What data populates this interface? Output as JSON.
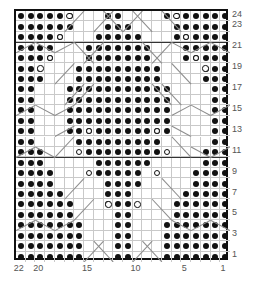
{
  "chart": {
    "kind": "knitting-stitch-chart",
    "title": "",
    "columns": 22,
    "rows": 24,
    "column_numbering_direction": "right-to-left",
    "row_numbering_direction": "bottom-to-top",
    "colors": {
      "grid_line": "#c9c9c9",
      "frame": "#111111",
      "symbol_fill": "#111111",
      "background": "#ffffff",
      "label": "#555555",
      "repeat_rule": "#333333"
    },
    "row_labels": [
      {
        "row": 24,
        "label": "24"
      },
      {
        "row": 23,
        "label": "23"
      },
      {
        "row": 21,
        "label": "21"
      },
      {
        "row": 19,
        "label": "19"
      },
      {
        "row": 17,
        "label": "17"
      },
      {
        "row": 15,
        "label": "15"
      },
      {
        "row": 13,
        "label": "13"
      },
      {
        "row": 11,
        "label": "11"
      },
      {
        "row": 9,
        "label": "9"
      },
      {
        "row": 7,
        "label": "7"
      },
      {
        "row": 5,
        "label": "5"
      },
      {
        "row": 3,
        "label": "3"
      },
      {
        "row": 1,
        "label": "1"
      }
    ],
    "column_labels": [
      {
        "col": 22,
        "label": "22"
      },
      {
        "col": 20,
        "label": "20"
      },
      {
        "col": 15,
        "label": "15"
      },
      {
        "col": 10,
        "label": "10"
      },
      {
        "col": 5,
        "label": "5"
      },
      {
        "col": 1,
        "label": "1"
      }
    ],
    "repeat_rules_after_rows": [
      21,
      10
    ],
    "symbols": {
      "dot": "purl-stitch",
      "ring": "yarn-over"
    },
    "dots": {
      "24": [
        1,
        2,
        3,
        4,
        5,
        6,
        7,
        12,
        13,
        17,
        18,
        19,
        20,
        21,
        22
      ],
      "23": [
        1,
        2,
        3,
        4,
        5,
        6,
        11,
        12,
        13,
        17,
        18,
        19,
        20,
        21,
        22
      ],
      "22": [
        1,
        2,
        3,
        4,
        5,
        6,
        10,
        11,
        12,
        13,
        14,
        18,
        19,
        20,
        21,
        22
      ],
      "21": [
        1,
        2,
        3,
        4,
        5,
        9,
        10,
        11,
        12,
        13,
        14,
        15,
        19,
        20,
        21,
        22
      ],
      "20": [
        1,
        2,
        3,
        4,
        5,
        9,
        10,
        11,
        12,
        13,
        14,
        15,
        19,
        20,
        21,
        22
      ],
      "19": [
        1,
        2,
        3,
        8,
        9,
        10,
        11,
        12,
        13,
        14,
        15,
        16,
        20,
        21,
        22
      ],
      "18": [
        1,
        2,
        3,
        8,
        9,
        10,
        11,
        12,
        13,
        14,
        15,
        16,
        20,
        21,
        22
      ],
      "17": [
        1,
        2,
        7,
        8,
        9,
        10,
        11,
        12,
        13,
        14,
        15,
        16,
        17,
        21,
        22
      ],
      "16": [
        1,
        2,
        7,
        8,
        9,
        10,
        11,
        12,
        13,
        14,
        15,
        16,
        17,
        21,
        22
      ],
      "15": [
        1,
        2,
        7,
        8,
        9,
        10,
        11,
        12,
        13,
        14,
        15,
        16,
        17,
        21,
        22
      ],
      "14": [
        1,
        2,
        7,
        8,
        9,
        10,
        11,
        12,
        13,
        14,
        15,
        16,
        17,
        21,
        22
      ],
      "13": [
        1,
        2,
        7,
        8,
        9,
        10,
        11,
        12,
        13,
        14,
        15,
        16,
        17,
        21,
        22
      ],
      "12": [
        1,
        2,
        8,
        9,
        10,
        11,
        12,
        13,
        14,
        15,
        16,
        21,
        22
      ],
      "11": [
        1,
        2,
        3,
        8,
        9,
        10,
        11,
        12,
        13,
        14,
        15,
        20,
        21,
        22
      ],
      "10": [
        1,
        2,
        3,
        9,
        10,
        11,
        12,
        13,
        14,
        20,
        21,
        22
      ],
      "9": [
        1,
        2,
        3,
        4,
        10,
        11,
        12,
        13,
        14,
        19,
        20,
        21,
        22
      ],
      "8": [
        1,
        2,
        3,
        4,
        10,
        11,
        12,
        13,
        19,
        20,
        21,
        22
      ],
      "7": [
        1,
        2,
        3,
        4,
        5,
        11,
        12,
        13,
        18,
        19,
        20,
        21,
        22
      ],
      "6": [
        1,
        2,
        3,
        4,
        5,
        6,
        11,
        12,
        13,
        17,
        18,
        19,
        20,
        21,
        22
      ],
      "5": [
        1,
        2,
        3,
        4,
        5,
        6,
        11,
        12,
        17,
        18,
        19,
        20,
        21,
        22
      ],
      "4": [
        1,
        2,
        3,
        4,
        5,
        6,
        7,
        11,
        12,
        16,
        17,
        18,
        19,
        20,
        21,
        22
      ],
      "3": [
        1,
        2,
        3,
        4,
        5,
        6,
        7,
        11,
        12,
        16,
        17,
        18,
        19,
        20,
        21,
        22
      ],
      "2": [
        1,
        2,
        3,
        4,
        5,
        6,
        7,
        11,
        12,
        16,
        17,
        18,
        19,
        20,
        21,
        22
      ],
      "1": [
        1,
        2,
        3,
        4,
        5,
        6,
        7,
        11,
        12,
        16,
        17,
        18,
        19,
        20,
        21,
        22
      ]
    },
    "rings": {
      "24": [
        17,
        6
      ],
      "22": [
        18,
        5
      ],
      "20": [
        19,
        4
      ],
      "19": [
        20,
        3
      ],
      "13": [
        15,
        8
      ],
      "11": [
        16,
        7
      ],
      "9": [
        15,
        8
      ],
      "6": [
        13,
        10
      ]
    },
    "lines": [
      {
        "x1": 0.0,
        "y1": 4.0,
        "x2": 2.0,
        "y2": 3.0
      },
      {
        "x1": 2.0,
        "y1": 3.0,
        "x2": 4.0,
        "y2": 4.0
      },
      {
        "x1": 4.0,
        "y1": 4.0,
        "x2": 6.0,
        "y2": 3.0
      },
      {
        "x1": 5.0,
        "y1": 2.0,
        "x2": 7.0,
        "y2": 0.0
      },
      {
        "x1": 9.0,
        "y1": 0.0,
        "x2": 11.0,
        "y2": 2.0
      },
      {
        "x1": 11.0,
        "y1": 2.0,
        "x2": 13.0,
        "y2": 0.0
      },
      {
        "x1": 15.0,
        "y1": 0.0,
        "x2": 17.0,
        "y2": 2.0
      },
      {
        "x1": 16.0,
        "y1": 3.0,
        "x2": 18.0,
        "y2": 4.0
      },
      {
        "x1": 18.0,
        "y1": 4.0,
        "x2": 20.0,
        "y2": 3.0
      },
      {
        "x1": 20.0,
        "y1": 3.0,
        "x2": 22.0,
        "y2": 4.0
      },
      {
        "x1": 6.0,
        "y1": 3.0,
        "x2": 8.0,
        "y2": 5.0
      },
      {
        "x1": 14.0,
        "y1": 5.0,
        "x2": 16.0,
        "y2": 3.0
      },
      {
        "x1": 0.0,
        "y1": 10.0,
        "x2": 2.0,
        "y2": 9.0
      },
      {
        "x1": 2.0,
        "y1": 9.0,
        "x2": 4.0,
        "y2": 10.0
      },
      {
        "x1": 4.0,
        "y1": 10.0,
        "x2": 6.0,
        "y2": 9.0
      },
      {
        "x1": 18.0,
        "y1": 9.0,
        "x2": 20.0,
        "y2": 10.0
      },
      {
        "x1": 20.0,
        "y1": 10.0,
        "x2": 22.0,
        "y2": 9.0
      },
      {
        "x1": 16.0,
        "y1": 10.0,
        "x2": 18.0,
        "y2": 9.0
      },
      {
        "x1": 6.0,
        "y1": 9.0,
        "x2": 8.0,
        "y2": 7.0
      },
      {
        "x1": 14.0,
        "y1": 7.0,
        "x2": 16.0,
        "y2": 9.0
      },
      {
        "x1": 0.0,
        "y1": 14.0,
        "x2": 2.0,
        "y2": 13.0
      },
      {
        "x1": 2.0,
        "y1": 13.0,
        "x2": 4.0,
        "y2": 14.0
      },
      {
        "x1": 18.0,
        "y1": 13.0,
        "x2": 20.0,
        "y2": 14.0
      },
      {
        "x1": 20.0,
        "y1": 14.0,
        "x2": 22.0,
        "y2": 13.0
      },
      {
        "x1": 4.0,
        "y1": 14.0,
        "x2": 6.0,
        "y2": 12.0
      },
      {
        "x1": 16.0,
        "y1": 12.0,
        "x2": 18.0,
        "y2": 14.0
      },
      {
        "x1": 0.0,
        "y1": 21.0,
        "x2": 2.0,
        "y2": 20.0
      },
      {
        "x1": 2.0,
        "y1": 20.0,
        "x2": 4.0,
        "y2": 21.0
      },
      {
        "x1": 4.0,
        "y1": 21.0,
        "x2": 6.0,
        "y2": 20.0
      },
      {
        "x1": 16.0,
        "y1": 20.0,
        "x2": 18.0,
        "y2": 21.0
      },
      {
        "x1": 18.0,
        "y1": 21.0,
        "x2": 20.0,
        "y2": 20.0
      },
      {
        "x1": 20.0,
        "y1": 20.0,
        "x2": 22.0,
        "y2": 21.0
      },
      {
        "x1": 7.0,
        "y1": 24.0,
        "x2": 9.0,
        "y2": 22.0
      },
      {
        "x1": 13.0,
        "y1": 22.0,
        "x2": 15.0,
        "y2": 24.0
      },
      {
        "x1": 6.0,
        "y1": 20.0,
        "x2": 8.0,
        "y2": 18.0
      },
      {
        "x1": 14.0,
        "y1": 18.0,
        "x2": 16.0,
        "y2": 20.0
      },
      {
        "x1": 5.0,
        "y1": 18.0,
        "x2": 7.0,
        "y2": 16.0
      },
      {
        "x1": 15.0,
        "y1": 16.0,
        "x2": 17.0,
        "y2": 18.0
      },
      {
        "x1": 4.0,
        "y1": 12.0,
        "x2": 6.0,
        "y2": 11.0
      },
      {
        "x1": 16.0,
        "y1": 11.0,
        "x2": 18.0,
        "y2": 12.0
      },
      {
        "x1": 5.0,
        "y1": 9.0,
        "x2": 7.0,
        "y2": 7.0
      },
      {
        "x1": 15.0,
        "y1": 7.0,
        "x2": 17.0,
        "y2": 9.0
      },
      {
        "x1": 4.0,
        "y1": 7.0,
        "x2": 6.0,
        "y2": 5.0
      },
      {
        "x1": 16.0,
        "y1": 5.0,
        "x2": 18.0,
        "y2": 7.0
      },
      {
        "x1": 7.0,
        "y1": 5.0,
        "x2": 9.0,
        "y2": 3.0
      },
      {
        "x1": 13.0,
        "y1": 3.0,
        "x2": 15.0,
        "y2": 5.0
      },
      {
        "x1": 8.0,
        "y1": 22.0,
        "x2": 10.0,
        "y2": 24.0
      },
      {
        "x1": 12.0,
        "y1": 24.0,
        "x2": 14.0,
        "y2": 22.0
      },
      {
        "x1": 8.0,
        "y1": 2.0,
        "x2": 10.0,
        "y2": 0.0
      },
      {
        "x1": 12.0,
        "y1": 0.0,
        "x2": 14.0,
        "y2": 2.0
      }
    ]
  }
}
